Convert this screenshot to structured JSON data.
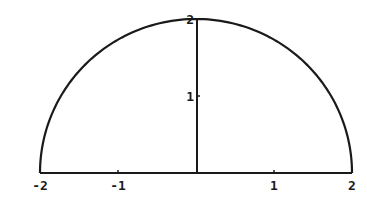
{
  "chart_data": {
    "type": "line",
    "title": "",
    "xlabel": "",
    "ylabel": "",
    "xlim": [
      -2,
      2
    ],
    "ylim": [
      0,
      2
    ],
    "grid": false,
    "legend": null,
    "x_ticks": [
      -2,
      -1,
      1,
      2
    ],
    "x_tick_labels": [
      "-2",
      "-1",
      "1",
      "2"
    ],
    "y_ticks": [
      1,
      2
    ],
    "y_tick_labels": [
      "1",
      "2"
    ],
    "series": [
      {
        "name": "semicircle",
        "x": [
          -2,
          -1.5,
          -1,
          -0.5,
          0,
          0.5,
          1,
          1.5,
          2
        ],
        "y": [
          0,
          1.32,
          1.73,
          1.94,
          2,
          1.94,
          1.73,
          1.32,
          0
        ]
      }
    ],
    "line_color": "#1a1a1a"
  }
}
